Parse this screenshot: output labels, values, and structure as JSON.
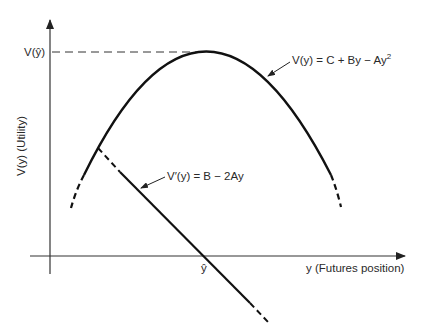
{
  "diagram": {
    "type": "utility-function-plot",
    "axes": {
      "x_label": "y (Futures position)",
      "y_label": "V(y) (Utility)"
    },
    "peak_label": "V(ŷ)",
    "x_marker": "ŷ",
    "curves": [
      {
        "name": "utility",
        "equation": "V(y) = C + By − Ay",
        "superscript": "2",
        "shape": "concave parabola"
      },
      {
        "name": "marginal-utility",
        "equation": "V′(y) = B − 2Ay",
        "shape": "downward sloping line crossing x-axis at ŷ"
      }
    ],
    "colors": {
      "line": "#111111",
      "axis": "#333333",
      "background": "#ffffff"
    }
  }
}
